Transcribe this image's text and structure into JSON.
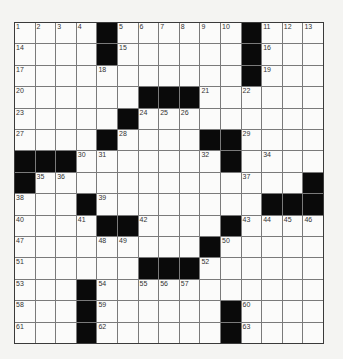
{
  "puzzle": {
    "rows": 15,
    "cols": 15,
    "colors": {
      "black": "#0a0a0a",
      "white": "#fbfbfa",
      "grid_line": "#7a7a7a",
      "background": "#f4f4f2"
    },
    "layout": [
      "....#......#...",
      "....#......#...",
      "...........#...",
      "......###......",
      ".....#.........",
      "....#....##....",
      "###.......#....",
      "#.............#",
      "...#........###",
      "....##....#....",
      ".........#.....",
      "......###......",
      "...#...........",
      "...#......#....",
      "...#......#...."
    ],
    "numbers": [
      [
        "1",
        "2",
        "3",
        "4",
        "",
        "5",
        "6",
        "7",
        "8",
        "9",
        "10",
        "",
        "11",
        "12",
        "13"
      ],
      [
        "14",
        "",
        "",
        "",
        "",
        "15",
        "",
        "",
        "",
        "",
        "",
        "",
        "16",
        "",
        ""
      ],
      [
        "17",
        "",
        "",
        "",
        "18",
        "",
        "",
        "",
        "",
        "",
        "",
        "",
        "19",
        "",
        ""
      ],
      [
        "20",
        "",
        "",
        "",
        "",
        "",
        "",
        "",
        "",
        "21",
        "",
        "22",
        "",
        "",
        ""
      ],
      [
        "23",
        "",
        "",
        "",
        "",
        "",
        "24",
        "25",
        "26",
        "",
        "",
        "",
        "",
        "",
        ""
      ],
      [
        "27",
        "",
        "",
        "",
        "",
        "28",
        "",
        "",
        "",
        "",
        "",
        "29",
        "",
        "",
        ""
      ],
      [
        "",
        "",
        "",
        "30",
        "31",
        "",
        "",
        "",
        "",
        "32",
        "33",
        "",
        "34",
        "",
        ""
      ],
      [
        "",
        "35",
        "36",
        "",
        "",
        "",
        "",
        "",
        "",
        "",
        "",
        "37",
        "",
        "",
        ""
      ],
      [
        "38",
        "",
        "",
        "",
        "39",
        "",
        "",
        "",
        "",
        "",
        "",
        "",
        "",
        "",
        ""
      ],
      [
        "40",
        "",
        "",
        "41",
        "",
        "",
        "42",
        "",
        "",
        "",
        "",
        "43",
        "44",
        "45",
        "46"
      ],
      [
        "47",
        "",
        "",
        "",
        "48",
        "49",
        "",
        "",
        "",
        "",
        "50",
        "",
        "",
        "",
        ""
      ],
      [
        "51",
        "",
        "",
        "",
        "",
        "",
        "",
        "",
        "",
        "52",
        "",
        "",
        "",
        "",
        ""
      ],
      [
        "53",
        "",
        "",
        "",
        "54",
        "",
        "55",
        "56",
        "57",
        "",
        "",
        "",
        "",
        "",
        ""
      ],
      [
        "58",
        "",
        "",
        "",
        "59",
        "",
        "",
        "",
        "",
        "",
        "",
        "60",
        "",
        "",
        ""
      ],
      [
        "61",
        "",
        "",
        "",
        "62",
        "",
        "",
        "",
        "",
        "",
        "",
        "63",
        "",
        "",
        ""
      ]
    ]
  }
}
